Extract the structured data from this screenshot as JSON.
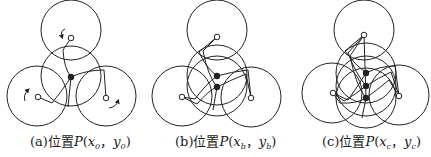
{
  "figure": {
    "stroke_color": "#222222",
    "panels": [
      {
        "id": "a",
        "label": "(a)",
        "caption_prefix": "位置",
        "point": "P",
        "x_var": "x",
        "x_sub": "0",
        "sep": "，",
        "y_var": "y",
        "y_sub": "0",
        "open_paren": "(",
        "close_paren": ")",
        "circles": [
          {
            "cx": 71,
            "cy": 30,
            "r": 30
          },
          {
            "cx": 71,
            "cy": 76,
            "r": 30
          },
          {
            "cx": 37,
            "cy": 96,
            "r": 30
          },
          {
            "cx": 106,
            "cy": 96,
            "r": 30
          }
        ],
        "pivots": [
          {
            "x": 71,
            "y": 38
          },
          {
            "x": 38,
            "y": 97
          },
          {
            "x": 106,
            "y": 98
          }
        ],
        "dots": [
          {
            "x": 71,
            "y": 77
          }
        ]
      },
      {
        "id": "b",
        "label": "(b)",
        "caption_prefix": "位置",
        "point": "P",
        "x_var": "x",
        "x_sub": "b",
        "sep": "，",
        "y_var": "y",
        "y_sub": "b",
        "open_paren": "(",
        "close_paren": ")",
        "circles": [
          {
            "cx": 217,
            "cy": 30,
            "r": 30
          },
          {
            "cx": 217,
            "cy": 75,
            "r": 30
          },
          {
            "cx": 217,
            "cy": 86,
            "r": 30
          },
          {
            "cx": 182,
            "cy": 96,
            "r": 30
          },
          {
            "cx": 251,
            "cy": 97,
            "r": 30
          }
        ],
        "pivots": [
          {
            "x": 217,
            "y": 37
          },
          {
            "x": 182,
            "y": 97
          },
          {
            "x": 251,
            "y": 98
          }
        ],
        "dots": [
          {
            "x": 217,
            "y": 76
          },
          {
            "x": 217,
            "y": 87
          }
        ]
      },
      {
        "id": "c",
        "label": "(c)",
        "caption_prefix": "位置",
        "point": "P",
        "x_var": "x",
        "x_sub": "c",
        "sep": "，",
        "y_var": "y",
        "y_sub": "c",
        "open_paren": "(",
        "close_paren": ")",
        "circles": [
          {
            "cx": 364,
            "cy": 30,
            "r": 30
          },
          {
            "cx": 366,
            "cy": 73,
            "r": 30
          },
          {
            "cx": 366,
            "cy": 86,
            "r": 30
          },
          {
            "cx": 366,
            "cy": 98,
            "r": 30
          },
          {
            "cx": 332,
            "cy": 93,
            "r": 30
          },
          {
            "cx": 399,
            "cy": 95,
            "r": 30
          }
        ],
        "pivots": [
          {
            "x": 364,
            "y": 35
          },
          {
            "x": 333,
            "y": 93
          },
          {
            "x": 399,
            "y": 96
          }
        ],
        "dots": [
          {
            "x": 366,
            "y": 73
          },
          {
            "x": 366,
            "y": 86
          },
          {
            "x": 366,
            "y": 98
          }
        ]
      }
    ]
  }
}
